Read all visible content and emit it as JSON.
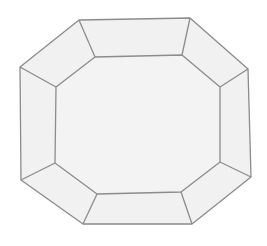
{
  "diagram": {
    "title": "",
    "colors": {
      "background": "#ffffff",
      "fill": "#f1f1f1",
      "table_fill": "#f3f3f3",
      "stroke": "#8c8c8c"
    },
    "outer_octagon": [
      [
        79,
        20
      ],
      [
        190,
        18
      ],
      [
        248,
        69
      ],
      [
        251,
        177
      ],
      [
        192,
        224
      ],
      [
        83,
        224
      ],
      [
        21,
        180
      ],
      [
        20,
        67
      ]
    ],
    "inner_octagon": [
      [
        95,
        57
      ],
      [
        182,
        55
      ],
      [
        220,
        87
      ],
      [
        220,
        162
      ],
      [
        181,
        192
      ],
      [
        97,
        194
      ],
      [
        55,
        163
      ],
      [
        56,
        87
      ]
    ]
  }
}
